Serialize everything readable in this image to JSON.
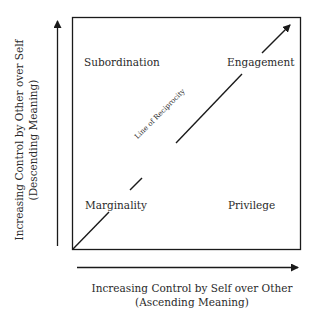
{
  "diagram": {
    "quadrants": {
      "top_left": "Subordination",
      "top_right": "Engagement",
      "bottom_left": "Marginality",
      "bottom_right": "Privilege"
    },
    "diagonal_label": "Line of Reciprocity",
    "x_axis": {
      "line1": "Increasing Control by Self over Other",
      "line2": "(Ascending Meaning)"
    },
    "y_axis": {
      "line1": "Increasing Control by Other over Self",
      "line2": "(Descending Meaning)"
    },
    "colors": {
      "line": "#1a1a1a",
      "text": "#2a2a2a",
      "background": "#ffffff"
    }
  }
}
